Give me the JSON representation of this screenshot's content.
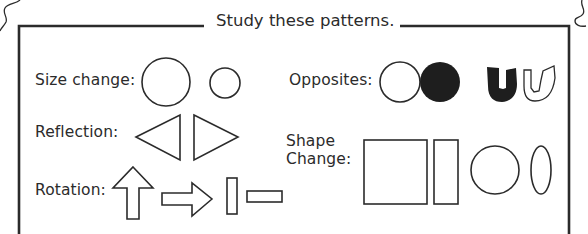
{
  "title": "Study these patterns.",
  "patterns": [
    {
      "label": "Size change:",
      "shapes": [
        "large-circle",
        "small-circle"
      ]
    },
    {
      "label": "Reflection:",
      "shapes": [
        "left-pointing-triangle",
        "right-pointing-triangle"
      ]
    },
    {
      "label": "Rotation:",
      "shapes": [
        "up-arrow",
        "right-arrow",
        "vertical-bar",
        "horizontal-bar"
      ]
    },
    {
      "label": "Opposites:",
      "shapes": [
        "outline-circle",
        "filled-circle",
        "filled-u-shape",
        "outline-u-shape"
      ]
    },
    {
      "label_line1": "Shape",
      "label_line2": "Change:",
      "shapes": [
        "square",
        "tall-rectangle",
        "circle",
        "ellipse"
      ]
    }
  ],
  "colors": {
    "ink": "#2b2b2b",
    "background": "#ffffff"
  }
}
